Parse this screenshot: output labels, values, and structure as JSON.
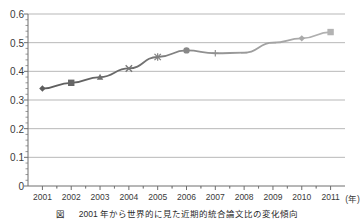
{
  "chart_data": {
    "type": "line",
    "title": "",
    "xlabel": "(年)",
    "ylabel": "",
    "categories": [
      "2001",
      "2002",
      "2003",
      "2004",
      "2005",
      "2006",
      "2007",
      "2008",
      "2009",
      "2010",
      "2011"
    ],
    "values": [
      0.34,
      0.36,
      0.38,
      0.41,
      0.45,
      0.473,
      0.463,
      0.465,
      0.5,
      0.515,
      0.537
    ],
    "series": [
      {
        "name": "",
        "values": [
          0.34,
          0.36,
          0.38,
          0.41,
          0.45,
          0.473,
          0.463,
          0.465,
          0.5,
          0.515,
          0.537
        ]
      }
    ],
    "ylim": [
      0,
      0.6
    ],
    "ytick_labels": [
      "0",
      "0.1",
      "0.2",
      "0.3",
      "0.4",
      "0.5",
      "0.6"
    ],
    "ytick_values": [
      0,
      0.1,
      0.2,
      0.3,
      0.4,
      0.5,
      0.6
    ],
    "xtick_labels": [
      "2001",
      "2002",
      "2003",
      "2004",
      "2005",
      "2006",
      "2007",
      "2008",
      "2009",
      "2010",
      "2011"
    ],
    "grid": "horizontal",
    "legend": "none",
    "markers": [
      "diamond",
      "square",
      "triangle",
      "x",
      "star",
      "circle",
      "plus",
      "dash",
      "dash",
      "diamond",
      "square"
    ],
    "line_color": "#8c8c8c",
    "grid_color": "#9a9a9a",
    "axis_color": "#6e6e6e",
    "minor_ticks_per_interval": 2
  },
  "axis": {
    "x_unit_label": "(年)"
  },
  "caption": {
    "text": "図 　 2001 年から世界的に見た近期的統合論文比の変化傾向"
  }
}
